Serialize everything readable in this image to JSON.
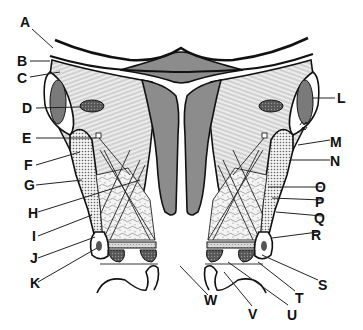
{
  "figure": {
    "type": "anatomical cross-section diagram (coronal section of pelvis / uterus and pelvic floor)",
    "style": "black-and-white line art with gray fills and stipple/hatch patterns",
    "colors": {
      "background": "#ffffff",
      "line": "#111111",
      "organ_fill": "#8c8c8c",
      "dark_fill": "#6e6e6e",
      "hatch_fill": "#e6e6e6",
      "stipple_fill": "#d4d4d4"
    }
  },
  "labels": {
    "left": [
      {
        "id": "A",
        "text": "A"
      },
      {
        "id": "B",
        "text": "B"
      },
      {
        "id": "C",
        "text": "C"
      },
      {
        "id": "D",
        "text": "D"
      },
      {
        "id": "E",
        "text": "E"
      },
      {
        "id": "F",
        "text": "F"
      },
      {
        "id": "G",
        "text": "G"
      },
      {
        "id": "H",
        "text": "H"
      },
      {
        "id": "I",
        "text": "I"
      },
      {
        "id": "J",
        "text": "J"
      },
      {
        "id": "K",
        "text": "K"
      }
    ],
    "right": [
      {
        "id": "L",
        "text": "L"
      },
      {
        "id": "M",
        "text": "M"
      },
      {
        "id": "N",
        "text": "N"
      },
      {
        "id": "O",
        "text": "O"
      },
      {
        "id": "P",
        "text": "P"
      },
      {
        "id": "Q",
        "text": "Q"
      },
      {
        "id": "R",
        "text": "R"
      },
      {
        "id": "S",
        "text": "S"
      },
      {
        "id": "T",
        "text": "T"
      }
    ],
    "bottom": [
      {
        "id": "W",
        "text": "W"
      },
      {
        "id": "V",
        "text": "V"
      },
      {
        "id": "U",
        "text": "U"
      }
    ]
  }
}
